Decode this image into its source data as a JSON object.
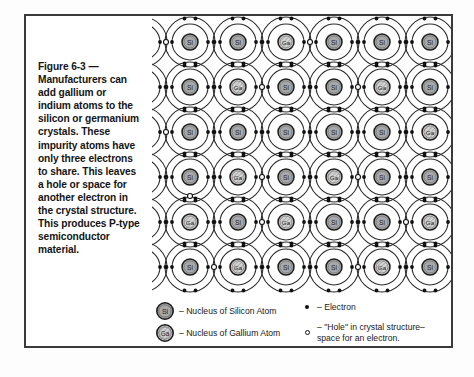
{
  "figure": {
    "caption": "Figure 6-3 —\nManufacturers can\nadd gallium or\nindium atoms to the\nsilicon or germanium\ncrystals. These\nimpurity atoms have\nonly three electrons\nto share. This leaves\na hole or space for\nanother electron in\nthe crystal structure.\nThis produces P-type\nsemiconductor\nmaterial."
  },
  "legend": {
    "items": [
      {
        "symbol": "silicon-nucleus-icon",
        "label": "Si",
        "text": "– Nucleus of Silicon Atom"
      },
      {
        "symbol": "gallium-nucleus-icon",
        "label": "Ga",
        "text": "– Nucleus of Gallium Atom"
      },
      {
        "symbol": "electron-dot-icon",
        "label": "",
        "text": "– Electron"
      },
      {
        "symbol": "hole-circle-icon",
        "label": "",
        "text": "– \"Hole\" in crystal structure–\n   space for an electron."
      }
    ]
  },
  "colors": {
    "frame_border": "#3a3a3c",
    "nucleus_fill_si": "#a8a8a8",
    "nucleus_fill_ga": "#cfcfcf",
    "nucleus_stroke": "#1c1c1c",
    "orbit_stroke": "#2a2a2a",
    "electron": "#111111",
    "hole_stroke": "#111111",
    "page_background": "#ffffff"
  },
  "lattice": {
    "cols": 7,
    "rows": 6,
    "cell_w": 48,
    "cell_h": 45,
    "origin_x": -10,
    "origin_y": 26,
    "outer_r": 25,
    "inner_r": 18,
    "nucleus_r": 8,
    "atoms": [
      [
        "Si",
        "Si",
        "Si",
        "Ga",
        "Si",
        "Si",
        "Si"
      ],
      [
        "Si",
        "Si",
        "Ga",
        "Si",
        "Si",
        "Ga",
        "Si"
      ],
      [
        "Si",
        "Si",
        "Si",
        "Si",
        "Si",
        "Si",
        "Ga"
      ],
      [
        "Si",
        "Si",
        "Ga",
        "Si",
        "Ga",
        "Si",
        "Si"
      ],
      [
        "Ga",
        "Ga",
        "Si",
        "Ga",
        "Si",
        "Si",
        "Ga"
      ],
      [
        "Si",
        "Si",
        "Ga",
        "Si",
        "Si",
        "Ga",
        "Si"
      ]
    ],
    "holes": [
      {
        "row": 0,
        "col": 1,
        "side": "left"
      },
      {
        "row": 0,
        "col": 4,
        "side": "left"
      },
      {
        "row": 1,
        "col": 3,
        "side": "left"
      },
      {
        "row": 1,
        "col": 5,
        "side": "left"
      },
      {
        "row": 2,
        "col": 1,
        "side": "left"
      },
      {
        "row": 3,
        "col": 0,
        "side": "below"
      },
      {
        "row": 3,
        "col": 3,
        "side": "left"
      },
      {
        "row": 3,
        "col": 5,
        "side": "left"
      },
      {
        "row": 3,
        "col": 6,
        "side": "right"
      },
      {
        "row": 4,
        "col": 1,
        "side": "above"
      },
      {
        "row": 4,
        "col": 3,
        "side": "left"
      },
      {
        "row": 4,
        "col": 6,
        "side": "left"
      },
      {
        "row": 5,
        "col": 2,
        "side": "left"
      },
      {
        "row": 5,
        "col": 5,
        "side": "left"
      }
    ]
  }
}
